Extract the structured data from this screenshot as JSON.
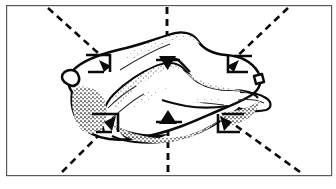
{
  "figure": {
    "style": "black and white stippled ink illustration",
    "background_color": "#ffffff",
    "ink_color": "#0b0b0b",
    "frame": {
      "name": "figure-border",
      "stroke_color": "#555a5e",
      "x": 6,
      "y": 5,
      "width": 325,
      "height": 170
    },
    "subject": {
      "name": "specimen-outline",
      "description": "irregular rounded organ-like mass, stippled shading, oriented horizontally",
      "fill_color": "#ffffff",
      "outline_color": "#0b0b0b"
    },
    "callouts": [
      {
        "id": "callout-top-left",
        "name": "callout-top-left",
        "leader_from": {
          "x": 48,
          "y": 8
        },
        "leader_to": {
          "x": 108,
          "y": 62
        },
        "bracket_corner": "top-right",
        "arrow_direction": "down-right"
      },
      {
        "id": "callout-top-center",
        "name": "callout-top-center",
        "leader_from": {
          "x": 167,
          "y": 7
        },
        "leader_to": {
          "x": 167,
          "y": 62
        },
        "bracket_corner": "none",
        "arrow_direction": "down"
      },
      {
        "id": "callout-top-right",
        "name": "callout-top-right",
        "leader_from": {
          "x": 288,
          "y": 8
        },
        "leader_to": {
          "x": 231,
          "y": 62
        },
        "bracket_corner": "top-left",
        "arrow_direction": "down-left"
      },
      {
        "id": "callout-bottom-left",
        "name": "callout-bottom-left",
        "leader_from": {
          "x": 62,
          "y": 172
        },
        "leader_to": {
          "x": 112,
          "y": 122
        },
        "bracket_corner": "bottom-left",
        "arrow_direction": "up-right"
      },
      {
        "id": "callout-bottom-center",
        "name": "callout-bottom-center",
        "leader_from": {
          "x": 168,
          "y": 172
        },
        "leader_to": {
          "x": 168,
          "y": 118
        },
        "bracket_corner": "none",
        "arrow_direction": "up"
      },
      {
        "id": "callout-bottom-right",
        "name": "callout-bottom-right",
        "leader_from": {
          "x": 300,
          "y": 172
        },
        "leader_to": {
          "x": 228,
          "y": 120
        },
        "bracket_corner": "bottom-right",
        "arrow_direction": "up-left"
      }
    ],
    "callout_count": "6",
    "labels": []
  }
}
